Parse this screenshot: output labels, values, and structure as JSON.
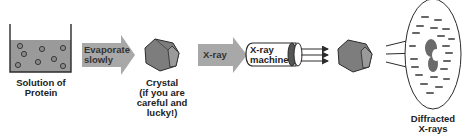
{
  "diagram": {
    "colors": {
      "background": "#ffffff",
      "liquid": "#9a9a9a",
      "arrow_fill": "#a8a8a8",
      "crystal_fill": "#7d7d7d",
      "crystal_side": "#9a9a9a",
      "outline": "#2b2b2b",
      "spot": "#555555"
    },
    "steps": [
      {
        "id": "solution",
        "label": "Solution of\nProtein",
        "icon": "beaker-icon"
      },
      {
        "id": "evaporate",
        "arrow_label": "Evaporate\nslowly",
        "icon": "block-arrow-icon"
      },
      {
        "id": "crystal",
        "label": "Crystal\n(if you are\ncareful and\nlucky!)",
        "icon": "hexagonal-crystal-icon"
      },
      {
        "id": "xray",
        "arrow_label": "X-ray",
        "icon": "block-arrow-icon"
      },
      {
        "id": "machine",
        "label": "X-ray\nmachine",
        "icon": "xray-machine-cylinder-icon"
      },
      {
        "id": "crystal2",
        "icon": "hexagonal-crystal-icon"
      },
      {
        "id": "diffraction",
        "label": "Diffracted\nX-rays",
        "icon": "diffraction-pattern-plate-icon"
      }
    ]
  }
}
